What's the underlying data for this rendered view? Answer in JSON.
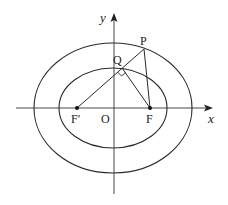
{
  "diagram": {
    "type": "ellipse-geometry",
    "axes": {
      "x_label": "x",
      "y_label": "y",
      "origin_label": "O"
    },
    "outer_ellipse": {
      "cx": 113,
      "cy": 108,
      "rx": 79,
      "ry": 65
    },
    "inner_ellipse": {
      "cx": 113,
      "cy": 108,
      "rx": 54,
      "ry": 40
    },
    "points": {
      "F_prime": {
        "label": "F′",
        "x": 77,
        "y": 108
      },
      "F": {
        "label": "F",
        "x": 150,
        "y": 108
      },
      "P": {
        "label": "P",
        "x": 144,
        "y": 49
      },
      "Q": {
        "label": "Q",
        "x": 122,
        "y": 68
      }
    },
    "segments": [
      "F′P",
      "QF",
      "PF"
    ],
    "annotations": [
      "right angle at Q between F′P and QF"
    ],
    "colors": {
      "stroke": "#2a2a2a",
      "background": "#ffffff"
    }
  }
}
